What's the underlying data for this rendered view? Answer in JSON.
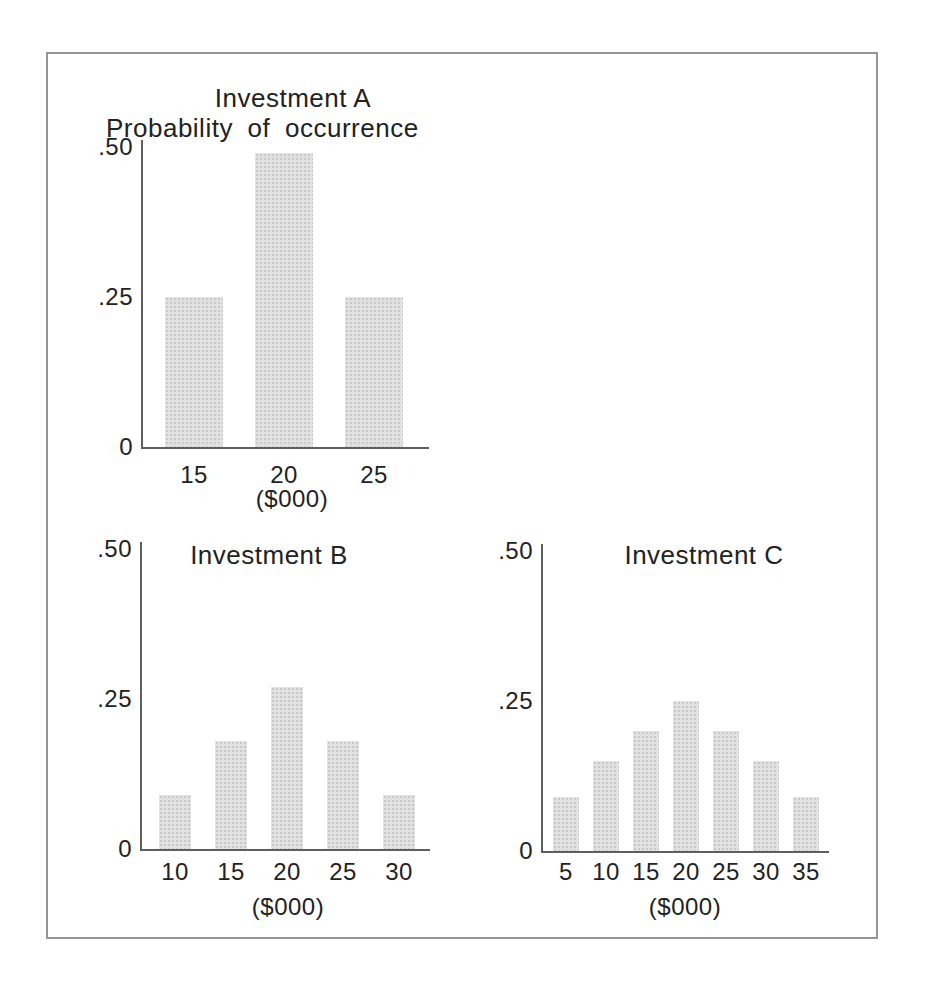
{
  "styles": {
    "background": "#ffffff",
    "frame_border_color": "#969696",
    "bar_color": "#e2e2e2",
    "bar_halftone_dot_color": "#c9c9c9",
    "axis_color": "#5f5f5f",
    "text_color": "#222222"
  },
  "chart_data": [
    {
      "type": "bar",
      "title": "Investment A",
      "ylabel": "Probability of occurrence",
      "xlabel": "($000)",
      "categories": [
        "15",
        "20",
        "25"
      ],
      "values": [
        0.25,
        0.49,
        0.25
      ],
      "ylim": [
        0,
        0.5
      ],
      "y_ticks": [
        {
          "label": ".50",
          "value": 0.5
        },
        {
          "label": ".25",
          "value": 0.25
        },
        {
          "label": "0",
          "value": 0
        }
      ],
      "grid": false,
      "legend": false
    },
    {
      "type": "bar",
      "title": "Investment B",
      "ylabel": "",
      "xlabel": "($000)",
      "categories": [
        "10",
        "15",
        "20",
        "25",
        "30"
      ],
      "values": [
        0.09,
        0.18,
        0.27,
        0.18,
        0.09
      ],
      "ylim": [
        0,
        0.5
      ],
      "y_ticks": [
        {
          "label": ".50",
          "value": 0.5
        },
        {
          "label": ".25",
          "value": 0.25
        },
        {
          "label": "0",
          "value": 0
        }
      ],
      "grid": false,
      "legend": false
    },
    {
      "type": "bar",
      "title": "Investment C",
      "ylabel": "",
      "xlabel": "($000)",
      "categories": [
        "5",
        "10",
        "15",
        "20",
        "25",
        "30",
        "35"
      ],
      "values": [
        0.09,
        0.15,
        0.2,
        0.25,
        0.2,
        0.15,
        0.09
      ],
      "ylim": [
        0,
        0.5
      ],
      "y_ticks": [
        {
          "label": ".50",
          "value": 0.5
        },
        {
          "label": ".25",
          "value": 0.25
        },
        {
          "label": "0",
          "value": 0
        }
      ],
      "grid": false,
      "legend": false
    }
  ]
}
